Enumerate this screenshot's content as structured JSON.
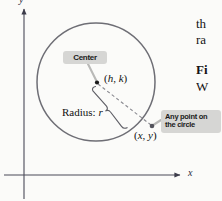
{
  "figure": {
    "type": "geometry-diagram",
    "background_color": "#fbfbf9",
    "axes": {
      "x_label": "x",
      "y_label": "y",
      "x_axis_color": "#4a4a58",
      "y_axis_color": "#4a4a58",
      "origin": {
        "x": 24,
        "y": 175
      }
    },
    "circle": {
      "color": "#6b6b72",
      "center_point": {
        "x": 96,
        "y": 82
      },
      "radius_px": 59,
      "point_on_circle": {
        "x": 152,
        "y": 126
      }
    },
    "labels": {
      "center_point_label": "(h, k)",
      "circle_point_label": "(x, y)",
      "radius_label": "Radius: r"
    },
    "callouts": [
      {
        "name": "center",
        "text": "Center",
        "background": "#d6d6d4",
        "text_color": "#1a1a1a"
      },
      {
        "name": "any-point-on-circle",
        "line_1": "Any point on",
        "line_2": "the circle",
        "background": "#d6d6d4",
        "text_color": "#1a1a1a"
      }
    ]
  },
  "page_text": {
    "line_1": "th",
    "line_2": "ra",
    "figure_heading": "Fi",
    "line_3": "W"
  }
}
